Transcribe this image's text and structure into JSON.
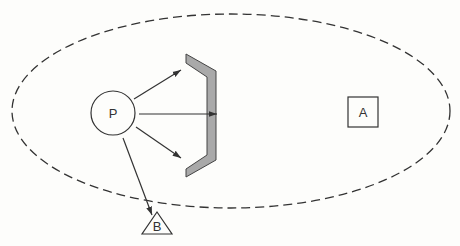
{
  "diagram": {
    "nodes": {
      "P": {
        "label": "P",
        "shape": "circle"
      },
      "A": {
        "label": "A",
        "shape": "square"
      },
      "B": {
        "label": "B",
        "shape": "triangle"
      }
    },
    "barrier": {
      "shape": "bracket",
      "fill": "#a9a9a9"
    },
    "boundary": {
      "shape": "dashed-ellipse"
    },
    "arrows": [
      {
        "from": "P",
        "to": "barrier",
        "direction": "upper"
      },
      {
        "from": "P",
        "to": "barrier",
        "direction": "middle"
      },
      {
        "from": "P",
        "to": "barrier",
        "direction": "lower"
      },
      {
        "from": "P",
        "to": "B"
      }
    ],
    "colors": {
      "stroke": "#333333",
      "barrier_fill": "#a9a9a9",
      "background": "#fdfdfb"
    }
  }
}
